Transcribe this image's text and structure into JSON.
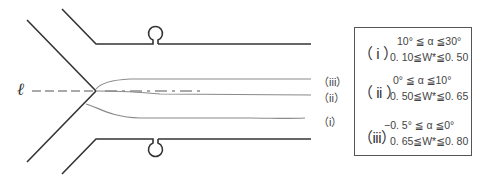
{
  "diagram": {
    "axis_label": "ℓ",
    "curve_labels": [
      {
        "id": "iii",
        "text": "（iii）"
      },
      {
        "id": "ii",
        "text": "（ii）"
      },
      {
        "id": "i",
        "text": "（i）"
      }
    ],
    "colors": {
      "wall": "#333333",
      "curve": "#8a8a8a",
      "axis": "#555555"
    }
  },
  "legend": {
    "entries": [
      {
        "roman": "（ i ）",
        "angle": "10° ≦ α ≦30°",
        "width": "0. 10≦W*≦0. 50"
      },
      {
        "roman": "（ ii ）",
        "angle": "0°  ≦ α ≦10°",
        "width": "0. 50≦W*≦0. 65"
      },
      {
        "roman": "（iii）",
        "angle": "−0. 5° ≦ α ≦0°",
        "width": "0. 65≦W*≦0. 80"
      }
    ]
  }
}
